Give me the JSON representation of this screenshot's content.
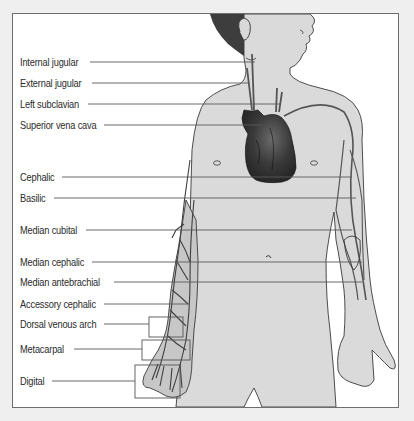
{
  "diagram": {
    "colors": {
      "background": "#efefef",
      "panel": "#ffffff",
      "skin": "#d9d9d9",
      "skin_outline": "#3a3a3a",
      "vein": "#555555",
      "heart": "#2f2f2f",
      "hair": "#3d3d3d",
      "leader_line": "#5a5a5a"
    },
    "labels": [
      {
        "id": "internal-jugular",
        "text": "Internal jugular",
        "y": 62
      },
      {
        "id": "external-jugular",
        "text": "External jugular",
        "y": 83
      },
      {
        "id": "left-subclavian",
        "text": "Left subclavian",
        "y": 104
      },
      {
        "id": "superior-vena-cava",
        "text": "Superior vena cava",
        "y": 125
      },
      {
        "id": "cephalic",
        "text": "Cephalic",
        "y": 177
      },
      {
        "id": "basilic",
        "text": "Basilic",
        "y": 198
      },
      {
        "id": "median-cubital",
        "text": "Median cubital",
        "y": 230
      },
      {
        "id": "median-cephalic",
        "text": "Median cephalic",
        "y": 262
      },
      {
        "id": "median-antebrachial",
        "text": "Median antebrachial",
        "y": 282
      },
      {
        "id": "accessory-cephalic",
        "text": "Accessory cephalic",
        "y": 304
      },
      {
        "id": "dorsal-venous-arch",
        "text": "Dorsal venous arch",
        "y": 324
      },
      {
        "id": "metacarpal",
        "text": "Metacarpal",
        "y": 349
      },
      {
        "id": "digital",
        "text": "Digital",
        "y": 381
      }
    ]
  }
}
